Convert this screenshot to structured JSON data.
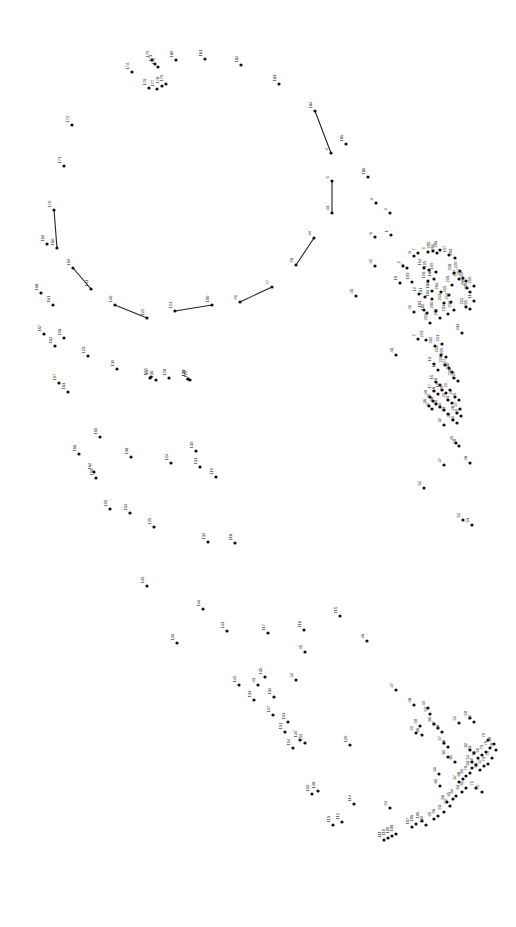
{
  "page": {
    "width": 516,
    "height": 927,
    "background_color": "#ffffff",
    "dot_color": "#111111",
    "label_color": "#1a1a1a",
    "line_color": "#222222",
    "label_rotation_deg": -90
  },
  "puzzle": {
    "total_dots": 233,
    "number_range": {
      "min": 1,
      "max": 233
    },
    "drawn_segments": [
      {
        "from": "170",
        "to": "160"
      },
      {
        "from": "159",
        "to": "141"
      },
      {
        "from": "140",
        "to": "122"
      },
      {
        "from": "121",
        "to": "100"
      },
      {
        "from": "99",
        "to": "77"
      },
      {
        "from": "184",
        "to": "4"
      },
      {
        "from": "5",
        "to": "43"
      },
      {
        "from": "44",
        "to": "26"
      }
    ],
    "dots": [
      {
        "n": "174",
        "x": 132,
        "y": 72
      },
      {
        "n": "173",
        "x": 155,
        "y": 64
      },
      {
        "n": "172",
        "x": 158,
        "y": 67
      },
      {
        "n": "175",
        "x": 152,
        "y": 60
      },
      {
        "n": "180",
        "x": 176,
        "y": 60
      },
      {
        "n": "181",
        "x": 205,
        "y": 59
      },
      {
        "n": "182",
        "x": 241,
        "y": 65
      },
      {
        "n": "176",
        "x": 149,
        "y": 88
      },
      {
        "n": "177",
        "x": 157,
        "y": 89
      },
      {
        "n": "178",
        "x": 162,
        "y": 86
      },
      {
        "n": "179",
        "x": 166,
        "y": 84
      },
      {
        "n": "183",
        "x": 279,
        "y": 84
      },
      {
        "n": "184",
        "x": 315,
        "y": 111
      },
      {
        "n": "185",
        "x": 346,
        "y": 144
      },
      {
        "n": "4",
        "x": 331,
        "y": 153
      },
      {
        "n": "186",
        "x": 368,
        "y": 177
      },
      {
        "n": "5",
        "x": 332,
        "y": 181
      },
      {
        "n": "43",
        "x": 332,
        "y": 213
      },
      {
        "n": "3",
        "x": 376,
        "y": 203
      },
      {
        "n": "2",
        "x": 390,
        "y": 213
      },
      {
        "n": "6",
        "x": 375,
        "y": 237
      },
      {
        "n": "1",
        "x": 391,
        "y": 235
      },
      {
        "n": "44",
        "x": 314,
        "y": 238
      },
      {
        "n": "26",
        "x": 296,
        "y": 265
      },
      {
        "n": "42",
        "x": 375,
        "y": 266
      },
      {
        "n": "45",
        "x": 356,
        "y": 296
      },
      {
        "n": "46",
        "x": 396,
        "y": 355
      },
      {
        "n": "8",
        "x": 414,
        "y": 256
      },
      {
        "n": "7",
        "x": 418,
        "y": 253
      },
      {
        "n": "9",
        "x": 428,
        "y": 252
      },
      {
        "n": "205",
        "x": 433,
        "y": 251
      },
      {
        "n": "204",
        "x": 437,
        "y": 253
      },
      {
        "n": "206",
        "x": 440,
        "y": 250
      },
      {
        "n": "197",
        "x": 449,
        "y": 255
      },
      {
        "n": "203",
        "x": 455,
        "y": 258
      },
      {
        "n": "2",
        "x": 403,
        "y": 266
      },
      {
        "n": "7b",
        "x": 407,
        "y": 268
      },
      {
        "n": "194",
        "x": 424,
        "y": 268
      },
      {
        "n": "195",
        "x": 429,
        "y": 270
      },
      {
        "n": "199",
        "x": 436,
        "y": 272
      },
      {
        "n": "218",
        "x": 454,
        "y": 273
      },
      {
        "n": "220",
        "x": 460,
        "y": 271
      },
      {
        "n": "217",
        "x": 459,
        "y": 279
      },
      {
        "n": "207",
        "x": 463,
        "y": 278
      },
      {
        "n": "219",
        "x": 466,
        "y": 281
      },
      {
        "n": "10",
        "x": 400,
        "y": 283
      },
      {
        "n": "190",
        "x": 412,
        "y": 282
      },
      {
        "n": "196",
        "x": 428,
        "y": 281
      },
      {
        "n": "189",
        "x": 434,
        "y": 279
      },
      {
        "n": "216",
        "x": 452,
        "y": 285
      },
      {
        "n": "208",
        "x": 467,
        "y": 288
      },
      {
        "n": "210",
        "x": 474,
        "y": 286
      },
      {
        "n": "209",
        "x": 470,
        "y": 292
      },
      {
        "n": "186b",
        "x": 432,
        "y": 291
      },
      {
        "n": "204b",
        "x": 441,
        "y": 292
      },
      {
        "n": "215",
        "x": 449,
        "y": 295
      },
      {
        "n": "11",
        "x": 474,
        "y": 301
      },
      {
        "n": "214",
        "x": 451,
        "y": 302
      },
      {
        "n": "213",
        "x": 444,
        "y": 303
      },
      {
        "n": "212",
        "x": 466,
        "y": 307
      },
      {
        "n": "211",
        "x": 470,
        "y": 309
      },
      {
        "n": "232",
        "x": 454,
        "y": 310
      },
      {
        "n": "231",
        "x": 448,
        "y": 314
      },
      {
        "n": "12",
        "x": 419,
        "y": 294
      },
      {
        "n": "101",
        "x": 425,
        "y": 297
      },
      {
        "n": "104",
        "x": 432,
        "y": 299
      },
      {
        "n": "41",
        "x": 414,
        "y": 312
      },
      {
        "n": "103",
        "x": 424,
        "y": 310
      },
      {
        "n": "102",
        "x": 427,
        "y": 313
      },
      {
        "n": "200",
        "x": 436,
        "y": 311
      },
      {
        "n": "201",
        "x": 440,
        "y": 318
      },
      {
        "n": "222",
        "x": 430,
        "y": 323
      },
      {
        "n": "233",
        "x": 462,
        "y": 333
      },
      {
        "n": "2b",
        "x": 418,
        "y": 339
      },
      {
        "n": "223",
        "x": 426,
        "y": 340
      },
      {
        "n": "221",
        "x": 442,
        "y": 344
      },
      {
        "n": "202",
        "x": 435,
        "y": 346
      },
      {
        "n": "224",
        "x": 441,
        "y": 355
      },
      {
        "n": "225",
        "x": 446,
        "y": 357
      },
      {
        "n": "226",
        "x": 445,
        "y": 365
      },
      {
        "n": "227",
        "x": 449,
        "y": 368
      },
      {
        "n": "230",
        "x": 452,
        "y": 372
      },
      {
        "n": "228",
        "x": 454,
        "y": 378
      },
      {
        "n": "229",
        "x": 458,
        "y": 381
      },
      {
        "n": "13",
        "x": 434,
        "y": 364
      },
      {
        "n": "14",
        "x": 438,
        "y": 370
      },
      {
        "n": "15",
        "x": 436,
        "y": 382
      },
      {
        "n": "16",
        "x": 440,
        "y": 385
      },
      {
        "n": "17",
        "x": 434,
        "y": 391
      },
      {
        "n": "18",
        "x": 438,
        "y": 394
      },
      {
        "n": "19",
        "x": 442,
        "y": 390
      },
      {
        "n": "20",
        "x": 446,
        "y": 393
      },
      {
        "n": "21",
        "x": 450,
        "y": 390
      },
      {
        "n": "22",
        "x": 448,
        "y": 400
      },
      {
        "n": "23",
        "x": 452,
        "y": 403
      },
      {
        "n": "24",
        "x": 455,
        "y": 397
      },
      {
        "n": "25",
        "x": 459,
        "y": 400
      },
      {
        "n": "40",
        "x": 430,
        "y": 397
      },
      {
        "n": "39",
        "x": 433,
        "y": 401
      },
      {
        "n": "38",
        "x": 436,
        "y": 404
      },
      {
        "n": "36",
        "x": 429,
        "y": 406
      },
      {
        "n": "37",
        "x": 432,
        "y": 409
      },
      {
        "n": "35",
        "x": 440,
        "y": 407
      },
      {
        "n": "34",
        "x": 444,
        "y": 410
      },
      {
        "n": "27",
        "x": 460,
        "y": 409
      },
      {
        "n": "28",
        "x": 457,
        "y": 413
      },
      {
        "n": "29",
        "x": 461,
        "y": 416
      },
      {
        "n": "33",
        "x": 448,
        "y": 414
      },
      {
        "n": "30",
        "x": 453,
        "y": 420
      },
      {
        "n": "31",
        "x": 457,
        "y": 423
      },
      {
        "n": "32",
        "x": 444,
        "y": 425
      },
      {
        "n": "49",
        "x": 456,
        "y": 443
      },
      {
        "n": "50",
        "x": 459,
        "y": 446
      },
      {
        "n": "47",
        "x": 444,
        "y": 465
      },
      {
        "n": "48",
        "x": 470,
        "y": 463
      },
      {
        "n": "52",
        "x": 463,
        "y": 520
      },
      {
        "n": "51",
        "x": 424,
        "y": 488
      },
      {
        "n": "53",
        "x": 472,
        "y": 525
      },
      {
        "n": "121",
        "x": 175,
        "y": 311
      },
      {
        "n": "100",
        "x": 212,
        "y": 305
      },
      {
        "n": "99",
        "x": 240,
        "y": 302
      },
      {
        "n": "77",
        "x": 272,
        "y": 287
      },
      {
        "n": "140",
        "x": 115,
        "y": 305
      },
      {
        "n": "122",
        "x": 147,
        "y": 318
      },
      {
        "n": "159",
        "x": 73,
        "y": 268
      },
      {
        "n": "141",
        "x": 91,
        "y": 289
      },
      {
        "n": "170",
        "x": 54,
        "y": 210
      },
      {
        "n": "160",
        "x": 57,
        "y": 248
      },
      {
        "n": "169",
        "x": 47,
        "y": 244
      },
      {
        "n": "171",
        "x": 64,
        "y": 166
      },
      {
        "n": "172b",
        "x": 72,
        "y": 125
      },
      {
        "n": "168",
        "x": 41,
        "y": 293
      },
      {
        "n": "161",
        "x": 53,
        "y": 305
      },
      {
        "n": "167",
        "x": 44,
        "y": 334
      },
      {
        "n": "158",
        "x": 64,
        "y": 338
      },
      {
        "n": "162",
        "x": 55,
        "y": 346
      },
      {
        "n": "123",
        "x": 88,
        "y": 356
      },
      {
        "n": "139",
        "x": 117,
        "y": 369
      },
      {
        "n": "157",
        "x": 59,
        "y": 383
      },
      {
        "n": "163",
        "x": 68,
        "y": 392
      },
      {
        "n": "166",
        "x": 79,
        "y": 454
      },
      {
        "n": "165",
        "x": 100,
        "y": 437
      },
      {
        "n": "164",
        "x": 94,
        "y": 472
      },
      {
        "n": "156",
        "x": 96,
        "y": 478
      },
      {
        "n": "155",
        "x": 110,
        "y": 509
      },
      {
        "n": "154",
        "x": 130,
        "y": 513
      },
      {
        "n": "137",
        "x": 151,
        "y": 377
      },
      {
        "n": "138",
        "x": 131,
        "y": 457
      },
      {
        "n": "124",
        "x": 171,
        "y": 463
      },
      {
        "n": "125",
        "x": 154,
        "y": 527
      },
      {
        "n": "126",
        "x": 188,
        "y": 379
      },
      {
        "n": "136",
        "x": 156,
        "y": 380
      },
      {
        "n": "119",
        "x": 216,
        "y": 477
      },
      {
        "n": "118",
        "x": 235,
        "y": 543
      },
      {
        "n": "120",
        "x": 188,
        "y": 379
      },
      {
        "n": "127",
        "x": 150,
        "y": 378
      },
      {
        "n": "128",
        "x": 169,
        "y": 378
      },
      {
        "n": "129",
        "x": 190,
        "y": 380
      },
      {
        "n": "130",
        "x": 196,
        "y": 451
      },
      {
        "n": "131",
        "x": 200,
        "y": 467
      },
      {
        "n": "132",
        "x": 208,
        "y": 542
      },
      {
        "n": "145",
        "x": 147,
        "y": 586
      },
      {
        "n": "146",
        "x": 177,
        "y": 643
      },
      {
        "n": "144",
        "x": 203,
        "y": 609
      },
      {
        "n": "143",
        "x": 227,
        "y": 631
      },
      {
        "n": "142",
        "x": 239,
        "y": 685
      },
      {
        "n": "133",
        "x": 254,
        "y": 700
      },
      {
        "n": "134",
        "x": 274,
        "y": 697
      },
      {
        "n": "135",
        "x": 265,
        "y": 677
      },
      {
        "n": "117",
        "x": 268,
        "y": 633
      },
      {
        "n": "116",
        "x": 304,
        "y": 630
      },
      {
        "n": "115",
        "x": 340,
        "y": 616
      },
      {
        "n": "147",
        "x": 273,
        "y": 715
      },
      {
        "n": "151",
        "x": 285,
        "y": 732
      },
      {
        "n": "154b",
        "x": 293,
        "y": 748
      },
      {
        "n": "149",
        "x": 300,
        "y": 740
      },
      {
        "n": "150",
        "x": 312,
        "y": 794
      },
      {
        "n": "148",
        "x": 318,
        "y": 791
      },
      {
        "n": "152",
        "x": 305,
        "y": 743
      },
      {
        "n": "153",
        "x": 288,
        "y": 722
      },
      {
        "n": "113",
        "x": 333,
        "y": 825
      },
      {
        "n": "112",
        "x": 342,
        "y": 822
      },
      {
        "n": "111",
        "x": 384,
        "y": 840
      },
      {
        "n": "110",
        "x": 388,
        "y": 838
      },
      {
        "n": "109",
        "x": 392,
        "y": 836
      },
      {
        "n": "108",
        "x": 396,
        "y": 834
      },
      {
        "n": "107",
        "x": 412,
        "y": 827
      },
      {
        "n": "106",
        "x": 416,
        "y": 824
      },
      {
        "n": "105",
        "x": 422,
        "y": 821
      },
      {
        "n": "114",
        "x": 354,
        "y": 804
      },
      {
        "n": "104b",
        "x": 426,
        "y": 825
      },
      {
        "n": "120b",
        "x": 350,
        "y": 745
      },
      {
        "n": "94",
        "x": 390,
        "y": 808
      },
      {
        "n": "95",
        "x": 434,
        "y": 819
      },
      {
        "n": "96",
        "x": 438,
        "y": 816
      },
      {
        "n": "93",
        "x": 444,
        "y": 812
      },
      {
        "n": "92",
        "x": 450,
        "y": 806
      },
      {
        "n": "66",
        "x": 447,
        "y": 802
      },
      {
        "n": "65",
        "x": 453,
        "y": 799
      },
      {
        "n": "64",
        "x": 456,
        "y": 796
      },
      {
        "n": "63",
        "x": 462,
        "y": 792
      },
      {
        "n": "62",
        "x": 466,
        "y": 788
      },
      {
        "n": "67",
        "x": 459,
        "y": 782
      },
      {
        "n": "68",
        "x": 463,
        "y": 779
      },
      {
        "n": "61",
        "x": 439,
        "y": 774
      },
      {
        "n": "60",
        "x": 472,
        "y": 768
      },
      {
        "n": "59",
        "x": 476,
        "y": 765
      },
      {
        "n": "58",
        "x": 480,
        "y": 770
      },
      {
        "n": "57",
        "x": 484,
        "y": 766
      },
      {
        "n": "56",
        "x": 478,
        "y": 758
      },
      {
        "n": "55",
        "x": 482,
        "y": 755
      },
      {
        "n": "54",
        "x": 472,
        "y": 762
      },
      {
        "n": "69",
        "x": 466,
        "y": 776
      },
      {
        "n": "70",
        "x": 470,
        "y": 773
      },
      {
        "n": "71",
        "x": 476,
        "y": 788
      },
      {
        "n": "72",
        "x": 482,
        "y": 792
      },
      {
        "n": "73",
        "x": 488,
        "y": 764
      },
      {
        "n": "74",
        "x": 492,
        "y": 758
      },
      {
        "n": "75",
        "x": 486,
        "y": 752
      },
      {
        "n": "76",
        "x": 490,
        "y": 748
      },
      {
        "n": "78",
        "x": 496,
        "y": 750
      },
      {
        "n": "79",
        "x": 488,
        "y": 740
      },
      {
        "n": "80",
        "x": 494,
        "y": 744
      },
      {
        "n": "81",
        "x": 455,
        "y": 762
      },
      {
        "n": "82",
        "x": 470,
        "y": 750
      },
      {
        "n": "83",
        "x": 474,
        "y": 753
      },
      {
        "n": "84",
        "x": 448,
        "y": 757
      },
      {
        "n": "85",
        "x": 440,
        "y": 786
      },
      {
        "n": "86",
        "x": 422,
        "y": 735
      },
      {
        "n": "87",
        "x": 438,
        "y": 728
      },
      {
        "n": "88",
        "x": 442,
        "y": 732
      },
      {
        "n": "89",
        "x": 434,
        "y": 724
      },
      {
        "n": "90",
        "x": 420,
        "y": 726
      },
      {
        "n": "91",
        "x": 416,
        "y": 733
      },
      {
        "n": "97",
        "x": 444,
        "y": 743
      },
      {
        "n": "98",
        "x": 448,
        "y": 747
      },
      {
        "n": "51b",
        "x": 459,
        "y": 723
      },
      {
        "n": "50b",
        "x": 470,
        "y": 718
      },
      {
        "n": "52b",
        "x": 474,
        "y": 722
      },
      {
        "n": "53b",
        "x": 430,
        "y": 714
      },
      {
        "n": "49b",
        "x": 428,
        "y": 708
      },
      {
        "n": "48b",
        "x": 414,
        "y": 705
      },
      {
        "n": "47b",
        "x": 396,
        "y": 690
      },
      {
        "n": "46b",
        "x": 367,
        "y": 641
      },
      {
        "n": "45b",
        "x": 305,
        "y": 652
      },
      {
        "n": "44b",
        "x": 296,
        "y": 680
      },
      {
        "n": "43b",
        "x": 258,
        "y": 685
      }
    ]
  }
}
